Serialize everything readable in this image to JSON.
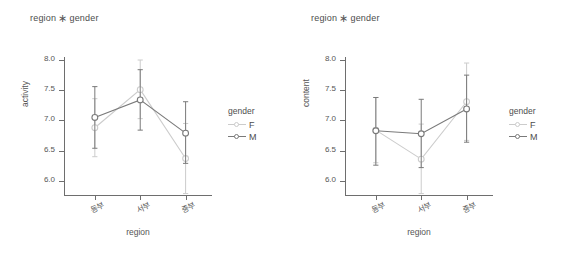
{
  "figure": {
    "background": "#ffffff",
    "panels": [
      {
        "id": "activity",
        "title_left": "region",
        "title_sep": "∗",
        "title_right": "gender",
        "xlabel": "region",
        "ylabel": "activity"
      },
      {
        "id": "content",
        "title_left": "region",
        "title_sep": "∗",
        "title_right": "gender",
        "xlabel": "region",
        "ylabel": "content"
      }
    ]
  },
  "legend": {
    "title": "gender",
    "entries": [
      {
        "label": "F",
        "color": "#cccccc"
      },
      {
        "label": "M",
        "color": "#7a7a7a"
      }
    ]
  },
  "axis": {
    "ytick_labels": [
      "8.0",
      "7.5",
      "7.0",
      "6.5",
      "6.0"
    ],
    "ytick_values": [
      8.0,
      7.5,
      7.0,
      6.5,
      6.0
    ],
    "xtick_labels": [
      "동부",
      "서부",
      "중부"
    ]
  },
  "chart_data": [
    {
      "type": "line",
      "title": "region ∗ gender",
      "xlabel": "region",
      "ylabel": "activity",
      "categories": [
        "동부",
        "서부",
        "중부"
      ],
      "ylim": [
        5.75,
        8.05
      ],
      "yticks": [
        6.0,
        6.5,
        7.0,
        7.5,
        8.0
      ],
      "grid": false,
      "legend": "right",
      "errorbars": "95% CI",
      "series": [
        {
          "name": "F",
          "color": "#cccccc",
          "values": [
            6.88,
            7.51,
            6.37
          ],
          "err_low": [
            6.4,
            7.03,
            5.79
          ],
          "err_high": [
            7.36,
            8.0,
            6.95
          ]
        },
        {
          "name": "M",
          "color": "#7a7a7a",
          "values": [
            7.05,
            7.34,
            6.79
          ],
          "err_low": [
            6.54,
            6.84,
            6.29
          ],
          "err_high": [
            7.56,
            7.84,
            7.31
          ]
        }
      ]
    },
    {
      "type": "line",
      "title": "region ∗ gender",
      "xlabel": "region",
      "ylabel": "content",
      "categories": [
        "동부",
        "서부",
        "중부"
      ],
      "ylim": [
        5.75,
        8.05
      ],
      "yticks": [
        6.0,
        6.5,
        7.0,
        7.5,
        8.0
      ],
      "grid": false,
      "legend": "right",
      "errorbars": "95% CI",
      "series": [
        {
          "name": "F",
          "color": "#cccccc",
          "values": [
            6.84,
            6.36,
            7.31
          ],
          "err_low": [
            6.3,
            5.79,
            6.67
          ],
          "err_high": [
            7.38,
            6.94,
            7.95
          ]
        },
        {
          "name": "M",
          "color": "#7a7a7a",
          "values": [
            6.83,
            6.78,
            7.19
          ],
          "err_low": [
            6.26,
            6.22,
            6.64
          ],
          "err_high": [
            7.38,
            7.35,
            7.75
          ]
        }
      ]
    }
  ]
}
